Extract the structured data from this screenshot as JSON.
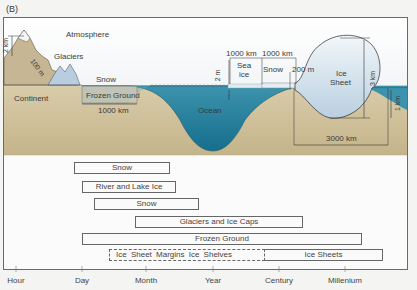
{
  "panel_label": "(B)",
  "scene": {
    "atmosphere": "Atmosphere",
    "glaciers": "Glaciers",
    "snow": "Snow",
    "continent": "Continent",
    "frozen_ground": "Frozen Ground",
    "frozen_ground_width": "1000 km",
    "ocean": "Ocean",
    "mountain_height": "2 km",
    "glacier_thickness": "100 m",
    "sea_ice_thickness": "2 m",
    "sea_ice_label_1": "Sea",
    "sea_ice_label_2": "ice",
    "sea_ice_width": "1000 km",
    "snow_on_ice_width": "1000 km",
    "snow_on_ice": "Snow",
    "ice_shelf_thickness": "200 m",
    "ice_sheet_label_1": "Ice",
    "ice_sheet_label_2": "Sheet",
    "ice_sheet_height": "3 km",
    "bedrock_depth": "1 km",
    "ice_sheet_width": "3000 km"
  },
  "timescale": {
    "axis_ticks": [
      {
        "label": "Hour",
        "x": 16
      },
      {
        "label": "Day",
        "x": 82
      },
      {
        "label": "Month",
        "x": 146
      },
      {
        "label": "Year",
        "x": 213
      },
      {
        "label": "Century",
        "x": 279
      },
      {
        "label": "Millenium",
        "x": 345
      }
    ],
    "bars": [
      {
        "label": "Snow",
        "x0": 74,
        "x1": 170,
        "y": 162,
        "dashed": false
      },
      {
        "label": "River and Lake Ice",
        "x0": 82,
        "x1": 176,
        "y": 181,
        "dashed": false
      },
      {
        "label": "Snow",
        "x0": 94,
        "x1": 199,
        "y": 198,
        "dashed": false
      },
      {
        "label": "Glaciers and Ice Caps",
        "x0": 135,
        "x1": 303,
        "y": 216,
        "dashed": false
      },
      {
        "label": "Frozen Ground",
        "x0": 82,
        "x1": 362,
        "y": 233,
        "dashed": false
      },
      {
        "label": "Ice Sheet Margins   Ice Shelves",
        "x0": 109,
        "x1": 265,
        "y": 249,
        "dashed": true
      },
      {
        "label": "Ice Sheets",
        "x0": 265,
        "x1": 383,
        "y": 249,
        "dashed": false
      }
    ]
  }
}
